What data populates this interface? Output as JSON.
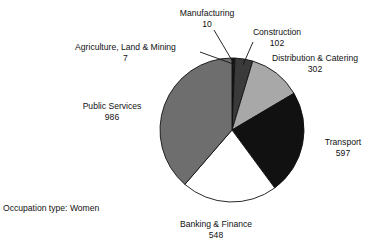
{
  "figure": {
    "caption": "Occupation type: Women",
    "cropped_top_text": ""
  },
  "chart_data": {
    "type": "pie",
    "title": "",
    "xlabel": "",
    "ylabel": "",
    "total": 2552,
    "legend_position": "none",
    "grid": false,
    "labels_show_value": true,
    "start_angle_deg": 0,
    "direction": "clockwise",
    "categories": [
      "Agriculture, Land & Mining",
      "Manufacturing",
      "Construction",
      "Distribution & Catering",
      "Transport",
      "Banking & Finance",
      "Public Services"
    ],
    "values": [
      7,
      10,
      102,
      302,
      597,
      548,
      986
    ],
    "colors": [
      "#2e2e2e",
      "#1c1c1c",
      "#3a3a3a",
      "#a8a8a8",
      "#111111",
      "#ffffff",
      "#6e6e6e"
    ],
    "slices": [
      {
        "label": "Agriculture, Land & Mining",
        "value": 7,
        "value_text": "7",
        "color": "#2e2e2e",
        "leader": true
      },
      {
        "label": "Manufacturing",
        "value": 10,
        "value_text": "10",
        "color": "#1c1c1c",
        "leader": true
      },
      {
        "label": "Construction",
        "value": 102,
        "value_text": "102",
        "color": "#3a3a3a",
        "leader": true
      },
      {
        "label": "Distribution & Catering",
        "value": 302,
        "value_text": "302",
        "color": "#a8a8a8",
        "leader": false
      },
      {
        "label": "Transport",
        "value": 597,
        "value_text": "597",
        "color": "#111111",
        "leader": false
      },
      {
        "label": "Banking & Finance",
        "value": 548,
        "value_text": "548",
        "color": "#ffffff",
        "leader": false
      },
      {
        "label": "Public Services",
        "value": 986,
        "value_text": "986",
        "color": "#6e6e6e",
        "leader": false
      }
    ]
  },
  "labels": {
    "manufacturing": {
      "name": "Manufacturing",
      "value": "10"
    },
    "construction": {
      "name": "Construction",
      "value": "102"
    },
    "distribution": {
      "name": "Distribution & Catering",
      "value": "302"
    },
    "agriculture": {
      "name": "Agriculture, Land & Mining",
      "value": "7"
    },
    "public_services": {
      "name": "Public Services",
      "value": "986"
    },
    "transport": {
      "name": "Transport",
      "value": "597"
    },
    "banking": {
      "name": "Banking & Finance",
      "value": "548"
    }
  }
}
